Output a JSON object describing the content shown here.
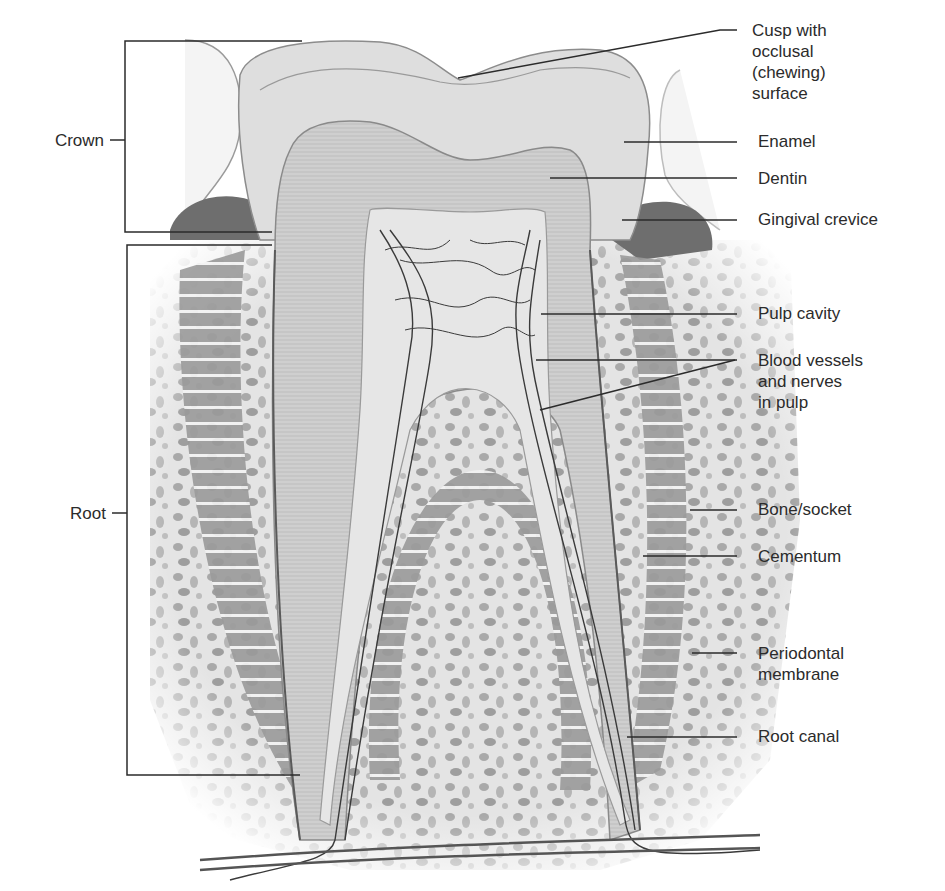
{
  "figure": {
    "colors": {
      "background": "#ffffff",
      "enamel": "#dedede",
      "dentin": "#c9c9c9",
      "pulp": "#e6e6e6",
      "vessels": "#3a3a3a",
      "gingiva": "#6e6e6e",
      "bone": "#d8d8d8",
      "leader_line": "#2b2b2b"
    }
  },
  "labels": {
    "left": {
      "crown": "Crown",
      "root": "Root"
    },
    "right": {
      "cusp": "Cusp with\nocclusal\n(chewing)\nsurface",
      "enamel": "Enamel",
      "dentin": "Dentin",
      "gingival_crevice": "Gingival crevice",
      "pulp_cavity": "Pulp cavity",
      "blood_vessels": "Blood vessels\nand nerves\nin pulp",
      "bone_socket": "Bone/socket",
      "cementum": "Cementum",
      "periodontal_membrane": "Periodontal\nmembrane",
      "root_canal": "Root canal"
    }
  }
}
